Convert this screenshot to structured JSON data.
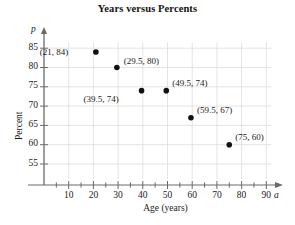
{
  "chart_data": {
    "type": "scatter",
    "title": "Years versus Percents",
    "xlabel": "Age (years)",
    "ylabel": "Percent",
    "x_axis_symbol": "a",
    "y_axis_symbol": "p",
    "xlim": [
      0,
      95
    ],
    "ylim": [
      52.5,
      87
    ],
    "xticks": [
      10,
      20,
      30,
      40,
      50,
      60,
      70,
      80,
      90
    ],
    "yticks": [
      55,
      60,
      65,
      70,
      75,
      80,
      85
    ],
    "xtick_labels": [
      "10",
      "20",
      "30",
      "40",
      "50",
      "60",
      "70",
      "80",
      "90"
    ],
    "ytick_labels": [
      "55",
      "60",
      "65",
      "70",
      "75",
      "80",
      "85"
    ],
    "minor_tick_step": 5,
    "grid": true,
    "grid_color": "#d8d8d8",
    "axis_color": "#6a6a6a",
    "point_color": "#111111",
    "legend": null,
    "points": [
      {
        "x": 21,
        "y": 84,
        "label": "(21, 84)",
        "label_pos": "left"
      },
      {
        "x": 29.5,
        "y": 80,
        "label": "(29.5, 80)",
        "label_pos": "right"
      },
      {
        "x": 39.5,
        "y": 74,
        "label": "(39.5, 74)",
        "label_pos": "below-left"
      },
      {
        "x": 49.5,
        "y": 74,
        "label": "(49.5, 74)",
        "label_pos": "above-right"
      },
      {
        "x": 59.5,
        "y": 67,
        "label": "(59.5, 67)",
        "label_pos": "above-right"
      },
      {
        "x": 75,
        "y": 60,
        "label": "(75, 60)",
        "label_pos": "above-right"
      }
    ]
  }
}
